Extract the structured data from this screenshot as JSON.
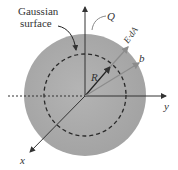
{
  "labels": {
    "gaussian_line1": "Gaussian",
    "gaussian_line2": "surface",
    "charge": "Q",
    "flux": "E·dA",
    "outer_radius": "b",
    "inner_radius": "R",
    "x_axis": "x",
    "y_axis": "y"
  },
  "colors": {
    "sphere_fill": "#a9a9a9",
    "sphere_edge": "#bdbdbd",
    "axis": "#333333",
    "dashed": "#2a2a2a",
    "ray": "#8c8c8c"
  }
}
